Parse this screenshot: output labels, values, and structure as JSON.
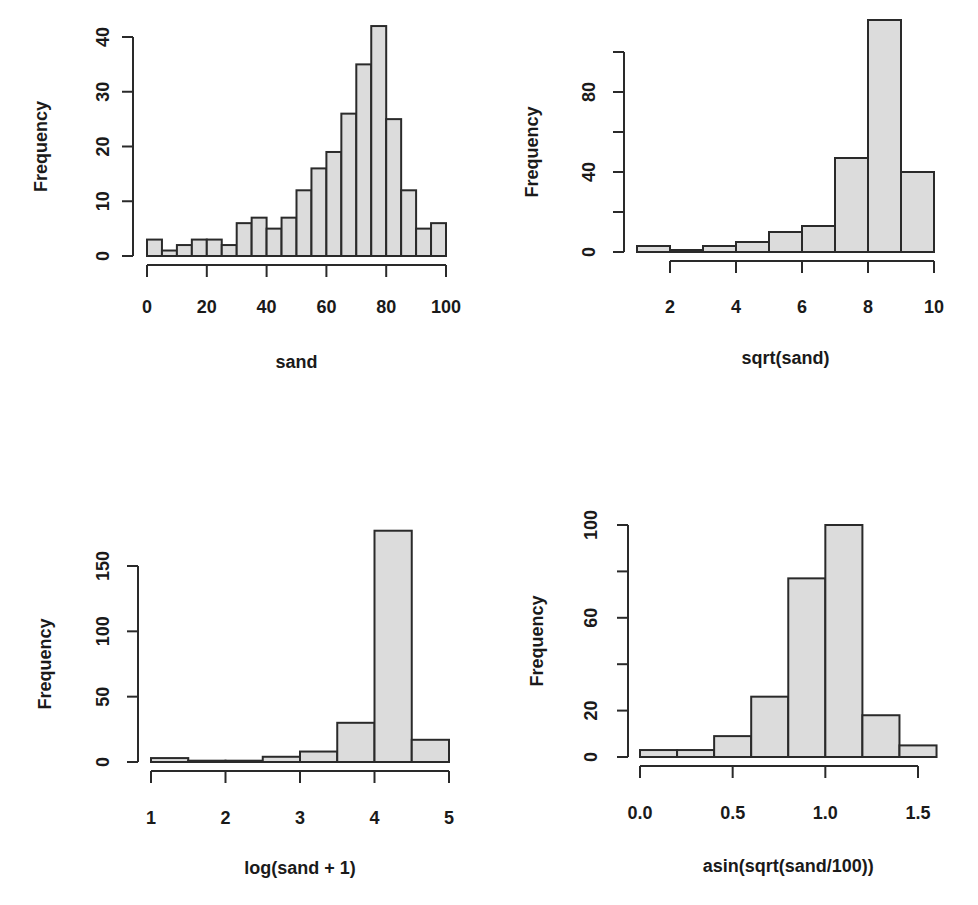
{
  "figure": {
    "background": "#ffffff",
    "bar_fill": "#dcdcdc",
    "bar_stroke": "#2a2a2a"
  },
  "chart_data": [
    {
      "type": "bar",
      "subtype": "histogram",
      "title": "",
      "xlabel": "sand",
      "ylabel": "Frequency",
      "bin_edges": [
        0,
        5,
        10,
        15,
        20,
        25,
        30,
        35,
        40,
        45,
        50,
        55,
        60,
        65,
        70,
        75,
        80,
        85,
        90,
        95,
        100
      ],
      "values": [
        3,
        1,
        2,
        3,
        3,
        2,
        6,
        7,
        5,
        7,
        12,
        16,
        19,
        26,
        35,
        42,
        25,
        12,
        5,
        6
      ],
      "xticks": [
        0,
        20,
        40,
        60,
        80,
        100
      ],
      "xtick_labels": [
        "0",
        "20",
        "40",
        "60",
        "80",
        "100"
      ],
      "yticks": [
        0,
        10,
        20,
        30,
        40
      ],
      "ytick_labels": [
        "0",
        "10",
        "20",
        "30",
        "40"
      ],
      "xlim": [
        0,
        100
      ],
      "ylim": [
        0,
        42
      ],
      "grid": false,
      "layout": {
        "x0px": 147,
        "x1px": 446,
        "y0px": 256,
        "yTopVal": 40,
        "yTopPx": 37,
        "yAxisX": 133,
        "xAxisY": 265,
        "xAxisFrom": 0,
        "xAxisTo": 100,
        "yAxisFrom": 0,
        "yAxisTo": 40,
        "ylabelX": 42,
        "xlabelY": 362,
        "tickLabelY": 306,
        "ytickLabelX": 104
      }
    },
    {
      "type": "bar",
      "subtype": "histogram",
      "title": "",
      "xlabel": "sqrt(sand)",
      "ylabel": "Frequency",
      "bin_edges": [
        1,
        2,
        3,
        4,
        5,
        6,
        7,
        8,
        9,
        10
      ],
      "values": [
        3,
        1,
        3,
        5,
        10,
        13,
        47,
        116,
        40
      ],
      "xticks": [
        2,
        4,
        6,
        8,
        10
      ],
      "xtick_labels": [
        "2",
        "4",
        "6",
        "8",
        "10"
      ],
      "yticks": [
        0,
        20,
        40,
        60,
        80,
        100
      ],
      "ytick_labels": [
        "0",
        "",
        "40",
        "",
        "80",
        ""
      ],
      "xlim": [
        1,
        10
      ],
      "ylim": [
        0,
        116
      ],
      "grid": false,
      "layout": {
        "x0px": 637,
        "x1px": 934,
        "y0px": 252,
        "yTopVal": 80,
        "yTopPx": 92,
        "yAxisX": 624,
        "xAxisY": 261,
        "xAxisFrom": 2,
        "xAxisTo": 10,
        "yAxisFrom": 0,
        "yAxisTo": 100,
        "ylabelX": 533,
        "xlabelY": 358,
        "tickLabelY": 306,
        "ytickLabelX": 590
      }
    },
    {
      "type": "bar",
      "subtype": "histogram",
      "title": "",
      "xlabel": "log(sand + 1)",
      "ylabel": "Frequency",
      "bin_edges": [
        1,
        1.5,
        2,
        2.5,
        3,
        3.5,
        4,
        4.5,
        5
      ],
      "values": [
        3,
        1,
        1,
        4,
        8,
        30,
        177,
        17
      ],
      "xticks": [
        1,
        2,
        3,
        4,
        5
      ],
      "xtick_labels": [
        "1",
        "2",
        "3",
        "4",
        "5"
      ],
      "yticks": [
        0,
        50,
        100,
        150
      ],
      "ytick_labels": [
        "0",
        "50",
        "100",
        "150"
      ],
      "xlim": [
        1,
        5
      ],
      "ylim": [
        0,
        177
      ],
      "grid": false,
      "layout": {
        "x0px": 151,
        "x1px": 449,
        "y0px": 762,
        "yTopVal": 150,
        "yTopPx": 566,
        "yAxisX": 138,
        "xAxisY": 771,
        "xAxisFrom": 1,
        "xAxisTo": 5,
        "yAxisFrom": 0,
        "yAxisTo": 150,
        "ylabelX": 46,
        "xlabelY": 868,
        "tickLabelY": 817,
        "ytickLabelX": 104
      }
    },
    {
      "type": "bar",
      "subtype": "histogram",
      "title": "",
      "xlabel": "asin(sqrt(sand/100))",
      "ylabel": "Frequency",
      "bin_edges": [
        0,
        0.2,
        0.4,
        0.6,
        0.8,
        1.0,
        1.2,
        1.4,
        1.6
      ],
      "values": [
        3,
        3,
        9,
        26,
        77,
        100,
        18,
        5
      ],
      "xticks": [
        0,
        0.5,
        1.0,
        1.5
      ],
      "xtick_labels": [
        "0.0",
        "0.5",
        "1.0",
        "1.5"
      ],
      "yticks": [
        0,
        20,
        40,
        60,
        80,
        100
      ],
      "ytick_labels": [
        "0",
        "20",
        "",
        "60",
        "",
        "100"
      ],
      "xlim": [
        0,
        1.6
      ],
      "ylim": [
        0,
        100
      ],
      "grid": false,
      "layout": {
        "x0px": 640,
        "x1px": 918,
        "x1val": 1.5,
        "y0px": 757,
        "yTopVal": 100,
        "yTopPx": 525,
        "yAxisX": 628,
        "xAxisY": 766,
        "xAxisFrom": 0,
        "xAxisTo": 1.5,
        "yAxisFrom": 0,
        "yAxisTo": 100,
        "ylabelX": 538,
        "xlabelY": 866,
        "tickLabelY": 812,
        "ytickLabelX": 592
      }
    }
  ]
}
